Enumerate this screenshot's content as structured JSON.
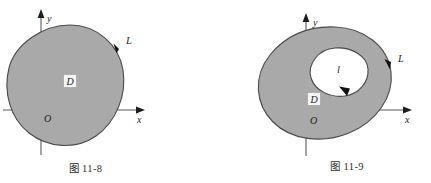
{
  "plate": {
    "description": "Two mathematical plane-region diagrams used for Green's theorem",
    "background_color": "#ffffff",
    "region_fill_color": "#a9a9a9",
    "region_stroke_color": "#4a4a4a",
    "axis_color": "#4e4e4e",
    "text_color": "#1d1d1d"
  },
  "figures": [
    {
      "id": "fig-11-8",
      "caption": "图 11-8",
      "axes": {
        "x_label": "x",
        "y_label": "y",
        "origin_label": "O"
      },
      "region_label": "D",
      "boundary_label": "L",
      "boundary_orientation": "counterclockwise",
      "holes": 0
    },
    {
      "id": "fig-11-9",
      "caption": "图 11-9",
      "axes": {
        "x_label": "x",
        "y_label": "y",
        "origin_label": "O"
      },
      "region_label": "D",
      "boundary_label": "L",
      "inner_boundary_label": "l",
      "boundary_orientation": "counterclockwise",
      "inner_boundary_orientation": "clockwise",
      "holes": 1
    }
  ]
}
